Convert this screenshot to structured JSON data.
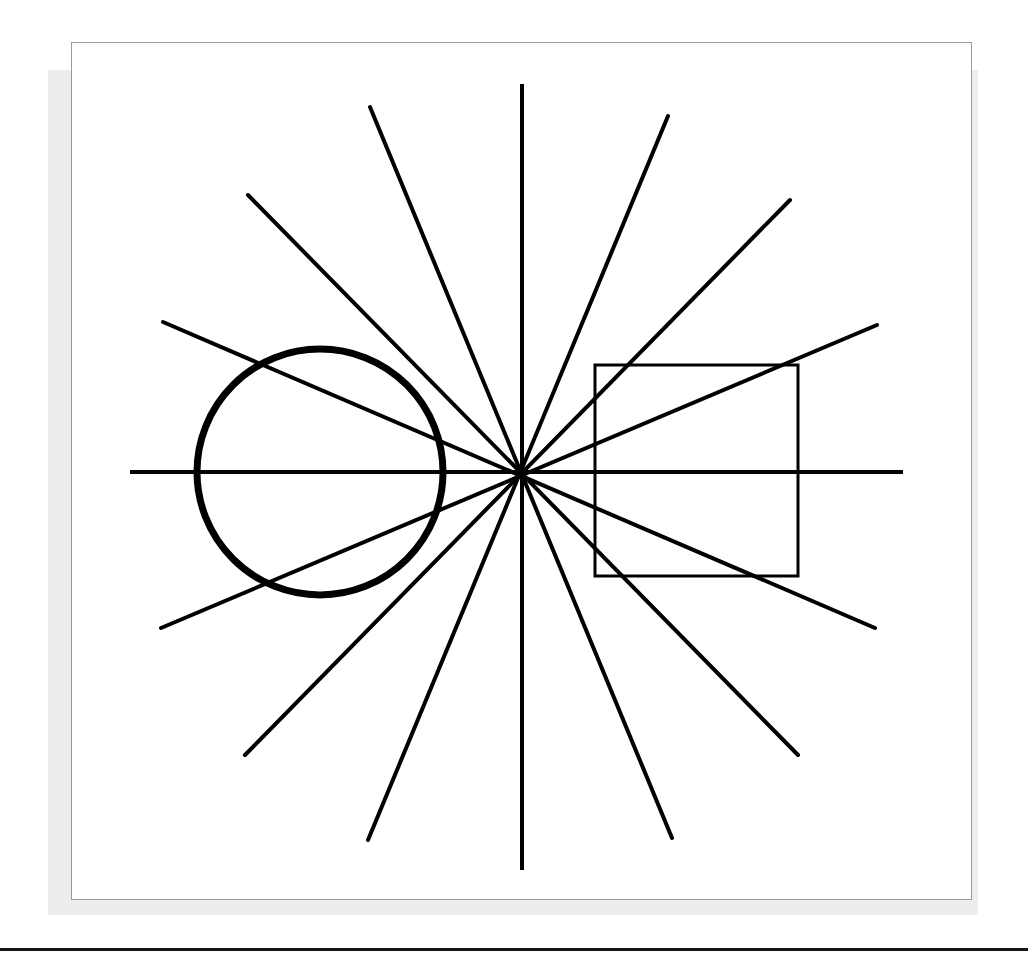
{
  "document": {
    "title": "Geometric line figure plate",
    "background_color": "#ffffff",
    "page_width": 1028,
    "page_height": 960
  },
  "plate": {
    "name": "framed-figure-plate",
    "x": 71,
    "y": 42,
    "width": 901,
    "height": 858,
    "border_color": "#9a9a9a",
    "border_width": 1,
    "fill": "#ffffff",
    "shadow": {
      "x": 48,
      "y": 70,
      "width": 930,
      "height": 845,
      "color": "#ededed"
    }
  },
  "bottom_rule": {
    "name": "page-bottom-rule",
    "x": 0,
    "y": 948,
    "width": 1028,
    "height": 3,
    "color": "#151515"
  },
  "figure": {
    "stroke_color": "#000000",
    "center": {
      "x": 522,
      "y": 472
    },
    "axes": {
      "vertical": {
        "x1": 522,
        "y1": 84,
        "x2": 522,
        "y2": 870,
        "stroke_width": 4
      },
      "horizontal": {
        "x1": 130,
        "y1": 472,
        "x2": 903,
        "y2": 472,
        "stroke_width": 4
      }
    },
    "radial_lines": [
      {
        "label": "ray-nnw-to-sse",
        "x1": 370,
        "y1": 107,
        "x2": 672,
        "y2": 838,
        "stroke_width": 4
      },
      {
        "label": "ray-nw-to-se",
        "x1": 248,
        "y1": 195,
        "x2": 798,
        "y2": 755,
        "stroke_width": 4
      },
      {
        "label": "ray-wnw-to-ese",
        "x1": 163,
        "y1": 322,
        "x2": 875,
        "y2": 628,
        "stroke_width": 4
      },
      {
        "label": "ray-wsw-to-ene",
        "x1": 161,
        "y1": 628,
        "x2": 877,
        "y2": 325,
        "stroke_width": 4
      },
      {
        "label": "ray-sw-to-ne",
        "x1": 245,
        "y1": 755,
        "x2": 790,
        "y2": 200,
        "stroke_width": 4
      },
      {
        "label": "ray-ssw-to-nne",
        "x1": 368,
        "y1": 840,
        "x2": 668,
        "y2": 116,
        "stroke_width": 4
      }
    ],
    "circle": {
      "label": "left-circle",
      "cx": 320,
      "cy": 472,
      "r": 123,
      "stroke_width": 7,
      "fill": "none"
    },
    "square": {
      "label": "right-square",
      "x": 595,
      "y": 365,
      "width": 203,
      "height": 211,
      "stroke_width": 3,
      "fill": "none"
    },
    "counts": {
      "total_straight_lines": 8,
      "rays_from_center": 16,
      "shapes": 2
    }
  }
}
